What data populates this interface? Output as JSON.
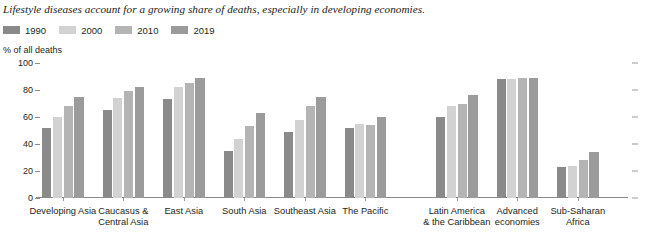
{
  "chart_data": {
    "type": "bar",
    "title": "Lifestyle diseases account for a growing share of deaths, especially in developing economies.",
    "xlabel": "",
    "ylabel": "% of all deaths",
    "ylim": [
      0,
      100
    ],
    "yticks": [
      "0",
      "20",
      "40",
      "60",
      "80",
      "100"
    ],
    "grid": false,
    "legend_position": "top-left",
    "categories": [
      "Developing Asia",
      "Caucasus &\nCentral Asia",
      "East Asia",
      "South Asia",
      "Southeast Asia",
      "The Pacific",
      "Latin America\n& the Caribbean",
      "Advanced\neconomies",
      "Sub-Saharan\nAfrica"
    ],
    "series": [
      {
        "name": "1990",
        "color": "#8a8a8a",
        "values": [
          52,
          65,
          73,
          35,
          49,
          52,
          60,
          88,
          23
        ]
      },
      {
        "name": "2000",
        "color": "#d2d2d2",
        "values": [
          60,
          74,
          82,
          44,
          58,
          55,
          68,
          88,
          24
        ]
      },
      {
        "name": "2010",
        "color": "#b4b4b4",
        "values": [
          68,
          79,
          85,
          53,
          68,
          54,
          70,
          89,
          28
        ]
      },
      {
        "name": "2019",
        "color": "#9b9b9b",
        "values": [
          75,
          82,
          89,
          63,
          75,
          60,
          76,
          89,
          34
        ]
      }
    ]
  }
}
